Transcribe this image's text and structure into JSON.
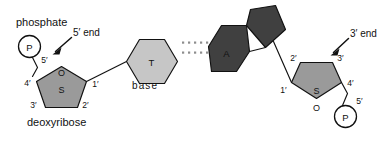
{
  "figure": {
    "colors": {
      "background": "#ffffff",
      "stroke": "#111111",
      "sugar_fill": "#9a9a9a",
      "pyrimidine_fill": "#c6c6c6",
      "purine_fill": "#404040",
      "phosphate_fill": "#ffffff",
      "hbond_dot": "#8d8d8d"
    }
  },
  "annotations": {
    "phosphate": "phosphate",
    "deoxyribose": "deoxyribose",
    "base": "base",
    "five_prime_end": "5′ end",
    "three_prime_end": "3′ end"
  },
  "left_strand": {
    "phosphate_label": "P",
    "sugar_label": "S",
    "oxygen_label": "O",
    "carbon_labels": {
      "c5": "5′",
      "c4": "4′",
      "c3": "3′",
      "c2": "2′",
      "c1": "1′"
    },
    "base_label": "T",
    "base_name": "thymine"
  },
  "right_strand": {
    "phosphate_label": "P",
    "sugar_label": "S",
    "oxygen_label": "O",
    "carbon_labels": {
      "c5": "5′",
      "c4": "4′",
      "c3": "3′",
      "c2": "2′",
      "c1": "1′"
    },
    "base_label": "A",
    "base_name": "adenine"
  },
  "hydrogen_bonds": {
    "rows": 2,
    "dots_per_row": 11
  }
}
